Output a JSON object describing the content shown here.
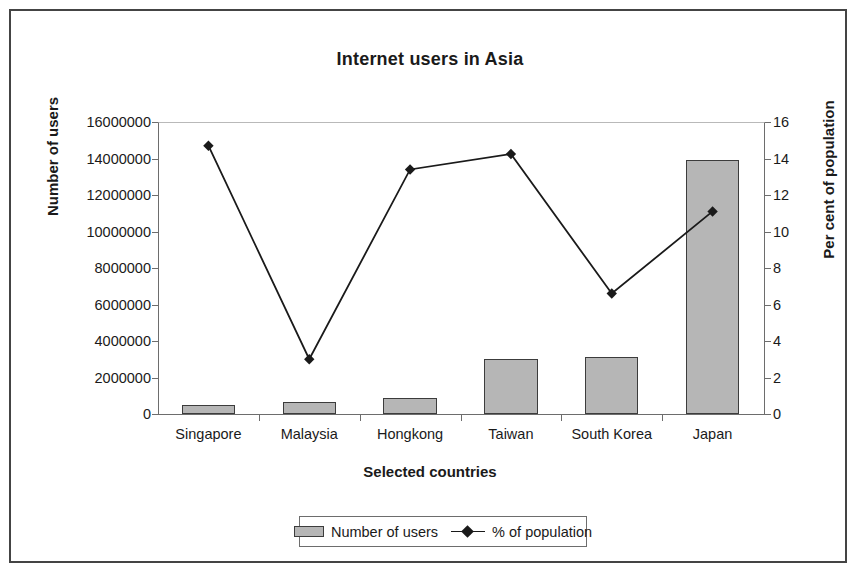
{
  "chart_data": {
    "type": "bar",
    "title": "Internet users in Asia",
    "xlabel": "Selected countries",
    "ylabel": "Number of users",
    "y2label": "Per cent of population",
    "categories": [
      "Singapore",
      "Malaysia",
      "Hongkong",
      "Taiwan",
      "South Korea",
      "Japan"
    ],
    "series": [
      {
        "name": "Number of users",
        "type": "bar",
        "axis": "left",
        "color": "#b6b6b6",
        "values": [
          500000,
          650000,
          900000,
          3000000,
          3100000,
          13900000
        ]
      },
      {
        "name": "% of population",
        "type": "line",
        "axis": "right",
        "color": "#1a1a1a",
        "marker": "diamond",
        "values": [
          14.7,
          3.0,
          13.4,
          14.25,
          6.6,
          11.1
        ]
      }
    ],
    "ylim": [
      0,
      16000000
    ],
    "y2lim": [
      0,
      16
    ],
    "yticks": [
      "0",
      "2000000",
      "4000000",
      "6000000",
      "8000000",
      "10000000",
      "12000000",
      "14000000",
      "16000000"
    ],
    "y2ticks": [
      "0",
      "2",
      "4",
      "6",
      "8",
      "10",
      "12",
      "14",
      "16"
    ],
    "grid": false,
    "legend_position": "bottom",
    "legend_entries": [
      "Number of users",
      "% of population"
    ]
  },
  "legend": {
    "bar_label": "Number of users",
    "line_label": "% of population"
  }
}
